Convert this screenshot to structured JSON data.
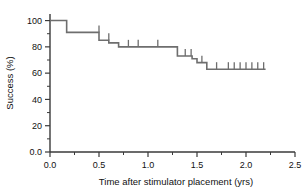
{
  "chart_data": {
    "type": "line",
    "subtype": "kaplan-meier-step",
    "title": "",
    "xlabel": "Time after stimulator placement (yrs)",
    "ylabel": "Success (%)",
    "xlim": [
      0.0,
      2.5
    ],
    "ylim": [
      0.0,
      105
    ],
    "grid": false,
    "legend": null,
    "x_ticks": [
      0.0,
      0.5,
      1.0,
      1.5,
      2.0,
      2.5
    ],
    "x_tick_labels": [
      "0.0",
      "0.5",
      "1.0",
      "1.5",
      "2.0",
      "2.5"
    ],
    "x_minor_ticks": [
      0.25,
      0.75,
      1.25,
      1.75,
      2.25
    ],
    "y_ticks": [
      0,
      20,
      40,
      60,
      80,
      100
    ],
    "y_tick_labels": [
      "0.0",
      "20",
      "40",
      "60",
      "80",
      "100"
    ],
    "y_minor_ticks": [
      10,
      30,
      50,
      70,
      90
    ],
    "series": [
      {
        "name": "Success",
        "step_points": [
          {
            "x": 0.0,
            "y": 100.0
          },
          {
            "x": 0.17,
            "y": 100.0
          },
          {
            "x": 0.17,
            "y": 91.0
          },
          {
            "x": 0.5,
            "y": 91.0
          },
          {
            "x": 0.5,
            "y": 85.0
          },
          {
            "x": 0.6,
            "y": 85.0
          },
          {
            "x": 0.6,
            "y": 83.0
          },
          {
            "x": 0.7,
            "y": 83.0
          },
          {
            "x": 0.7,
            "y": 80.0
          },
          {
            "x": 1.3,
            "y": 80.0
          },
          {
            "x": 1.3,
            "y": 73.0
          },
          {
            "x": 1.45,
            "y": 73.0
          },
          {
            "x": 1.45,
            "y": 71.0
          },
          {
            "x": 1.5,
            "y": 71.0
          },
          {
            "x": 1.5,
            "y": 68.0
          },
          {
            "x": 1.6,
            "y": 68.0
          },
          {
            "x": 1.6,
            "y": 63.0
          },
          {
            "x": 2.2,
            "y": 63.0
          }
        ],
        "censored": [
          {
            "x": 0.5,
            "y": 91.0
          },
          {
            "x": 0.6,
            "y": 85.0
          },
          {
            "x": 0.8,
            "y": 80.0
          },
          {
            "x": 0.9,
            "y": 80.0
          },
          {
            "x": 1.1,
            "y": 80.0
          },
          {
            "x": 1.38,
            "y": 73.0
          },
          {
            "x": 1.44,
            "y": 73.0
          },
          {
            "x": 1.55,
            "y": 68.0
          },
          {
            "x": 1.7,
            "y": 63.0
          },
          {
            "x": 1.82,
            "y": 63.0
          },
          {
            "x": 1.88,
            "y": 63.0
          },
          {
            "x": 1.94,
            "y": 63.0
          },
          {
            "x": 2.0,
            "y": 63.0
          },
          {
            "x": 2.06,
            "y": 63.0
          },
          {
            "x": 2.12,
            "y": 63.0
          },
          {
            "x": 2.18,
            "y": 63.0
          }
        ]
      }
    ],
    "colors": {
      "curve": "#6e6e6e",
      "axis": "#3a3a3a",
      "text": "#111111",
      "background": "#ffffff"
    }
  }
}
